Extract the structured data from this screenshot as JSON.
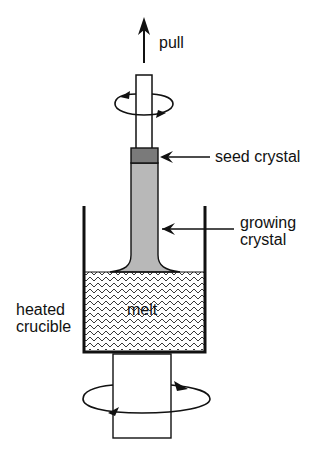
{
  "labels": {
    "pull": "pull",
    "seed_crystal": "seed crystal",
    "growing_crystal_line1": "growing",
    "growing_crystal_line2": "crystal",
    "melt": "melt",
    "heated_crucible_line1": "heated",
    "heated_crucible_line2": "crucible"
  },
  "colors": {
    "line": "#111111",
    "crystal": "#b8b8b8",
    "seed": "#7a7a7a",
    "melt_bg": "#ffffff"
  }
}
